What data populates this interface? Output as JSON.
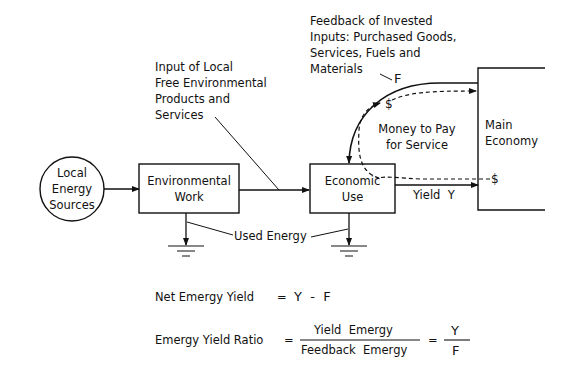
{
  "diagram": {
    "nodes": {
      "local_energy_sources": {
        "label_lines": [
          "Local",
          "Energy",
          "Sources"
        ],
        "shape": "circle"
      },
      "environmental_work": {
        "label_lines": [
          "Environmental",
          "Work"
        ],
        "shape": "box"
      },
      "economic_use": {
        "label_lines": [
          "Economic",
          "Use"
        ],
        "shape": "box"
      },
      "main_economy": {
        "label_lines": [
          "Main",
          "Economy"
        ],
        "shape": "open-box"
      }
    },
    "annotations": {
      "input_local": {
        "lines": [
          "Input of Local",
          "Free Environmental",
          "Products and",
          "Services"
        ]
      },
      "feedback": {
        "lines": [
          "Feedback of Invested",
          "Inputs: Purchased Goods,",
          "Services, Fuels and",
          "Materials"
        ],
        "symbol": "F"
      },
      "money": {
        "lines": [
          "Money to Pay",
          "for Service"
        ]
      },
      "dollar_top": "$",
      "dollar_right": "$",
      "yield_label": "Yield  Y",
      "used_energy": "Used Energy"
    },
    "equations": {
      "net": {
        "label": "Net Emergy Yield",
        "equals": "=",
        "expr": "Y  -  F"
      },
      "ratio": {
        "label": "Emergy Yield Ratio",
        "equals": "=",
        "numerator": "Yield  Emergy",
        "denominator": "Feedback  Emergy",
        "equals2": "=",
        "num2": "Y",
        "den2": "F"
      }
    },
    "colors": {
      "ink": "#111111",
      "background": "#ffffff"
    }
  }
}
